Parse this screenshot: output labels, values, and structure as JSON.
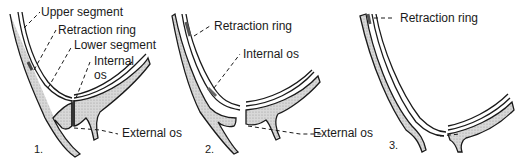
{
  "diagram": {
    "panels": [
      {
        "number": "1.",
        "labels": {
          "upper_segment": "Upper segment",
          "retraction_ring": "Retraction ring",
          "lower_segment": "Lower segment",
          "internal_os_line1": "Internal",
          "internal_os_line2": "os",
          "external_os": "External os"
        }
      },
      {
        "number": "2.",
        "labels": {
          "retraction_ring": "Retraction ring",
          "internal_os": "Internal os",
          "external_os": "External os"
        }
      },
      {
        "number": "3.",
        "labels": {
          "retraction_ring": "Retraction ring"
        }
      }
    ],
    "colors": {
      "line": "#1a1a1a",
      "tissue_fill": "#cfcfcf",
      "background": "#ffffff"
    }
  }
}
